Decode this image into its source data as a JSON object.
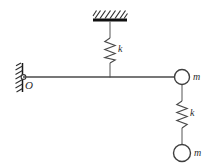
{
  "figure": {
    "background_color": "#ffffff",
    "ink_color": "#3a3a3a",
    "width": 212,
    "height": 168
  },
  "labels": {
    "origin": "O",
    "upper_spring": "k",
    "lower_spring": "k",
    "right_mass": "m",
    "bottom_mass": "m"
  },
  "supports": {
    "ceiling": {
      "name": "fixed-ceiling-support",
      "hatch_direction": "diagonal",
      "bar_x": 93,
      "bar_y": 19,
      "bar_width": 34,
      "bar_height": 3
    },
    "wall": {
      "name": "fixed-wall-support",
      "hatch_direction": "diagonal",
      "bar_x": 22,
      "bar_y_top": 63,
      "bar_y_bottom": 92
    }
  },
  "elements": {
    "pivot": {
      "cx": 23,
      "cy": 77,
      "r": 2.4
    },
    "beam": {
      "x1": 23,
      "y1": 77,
      "x2": 182,
      "y2": 77
    },
    "upper_spring": {
      "x": 110,
      "y_top": 22,
      "y_bottom": 77,
      "coil_top": 38,
      "coil_bottom": 63,
      "coils": 5,
      "amplitude": 5
    },
    "lower_spring": {
      "x": 182,
      "y_top": 86,
      "y_bottom": 145,
      "coil_top": 101,
      "coil_bottom": 128,
      "coils": 5,
      "amplitude": 5
    },
    "right_mass": {
      "cx": 182,
      "cy": 77,
      "r": 7.5
    },
    "bottom_mass": {
      "cx": 182,
      "cy": 153,
      "r": 8.5
    }
  }
}
